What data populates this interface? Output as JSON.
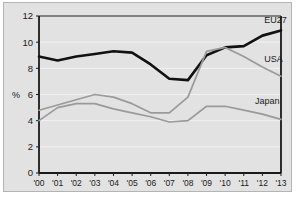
{
  "chart_data": {
    "type": "line",
    "title": "",
    "xlabel": "",
    "ylabel": "%",
    "ylim": [
      0,
      12
    ],
    "ytick_step": 2,
    "yticks": [
      "0",
      "2",
      "4",
      "6",
      "8",
      "10",
      "12"
    ],
    "grid": true,
    "grid_color": "#f2f2f2",
    "background_color": "#e2e2e2",
    "axis_color": "#1a1a1a",
    "legend_position": "inline-right-of-series",
    "categories": [
      "'00",
      "'01",
      "'02",
      "'03",
      "'04",
      "'05",
      "'06",
      "'07",
      "'08",
      "'09",
      "'10",
      "'11",
      "'12",
      "'13"
    ],
    "x": [
      2000,
      2001,
      2002,
      2003,
      2004,
      2005,
      2006,
      2007,
      2008,
      2009,
      2010,
      2011,
      2012,
      2013
    ],
    "series": [
      {
        "name": "EU27",
        "color": "#111111",
        "width": 2.6,
        "values": [
          8.9,
          8.6,
          8.9,
          9.1,
          9.3,
          9.2,
          8.3,
          7.2,
          7.1,
          9.0,
          9.6,
          9.7,
          10.5,
          10.9
        ],
        "label": "EU27",
        "label_x": 2012.1,
        "label_y": 11.45
      },
      {
        "name": "USA",
        "color": "#9a9a9a",
        "width": 1.7,
        "values": [
          4.8,
          5.2,
          5.6,
          6.0,
          5.8,
          5.3,
          4.6,
          4.6,
          5.8,
          9.3,
          9.6,
          8.9,
          8.1,
          7.4
        ],
        "label": "USA",
        "label_x": 2012.1,
        "label_y": 8.45
      },
      {
        "name": "Japan",
        "color": "#9a9a9a",
        "width": 1.7,
        "values": [
          4.0,
          5.0,
          5.3,
          5.3,
          4.9,
          4.6,
          4.3,
          3.9,
          4.0,
          5.1,
          5.1,
          4.8,
          4.5,
          4.1
        ],
        "label": "Japan",
        "label_x": 2011.6,
        "label_y": 5.25
      }
    ]
  }
}
